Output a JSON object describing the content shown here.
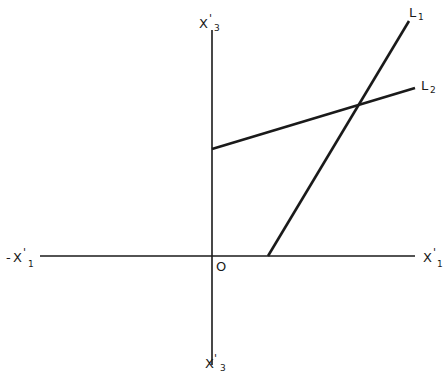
{
  "diagram": {
    "axes": {
      "horizontal_positive": {
        "base": "X",
        "prime": "'",
        "subscript": "1",
        "sign": ""
      },
      "horizontal_negative": {
        "base": "X",
        "prime": "'",
        "subscript": "1",
        "sign": "-"
      },
      "vertical_positive": {
        "base": "X",
        "prime": "'",
        "subscript": "3"
      },
      "vertical_negative": {
        "base": "X",
        "prime": "'",
        "subscript": "3"
      },
      "origin": "O"
    },
    "lines": [
      {
        "name": "L",
        "subscript": "1",
        "from": [
          268,
          256
        ],
        "to": [
          409,
          21
        ]
      },
      {
        "name": "L",
        "subscript": "2",
        "from": [
          212,
          149
        ],
        "to": [
          415,
          88
        ]
      }
    ],
    "colors": {
      "stroke": "#1a1a1a",
      "background": "#ffffff"
    }
  }
}
